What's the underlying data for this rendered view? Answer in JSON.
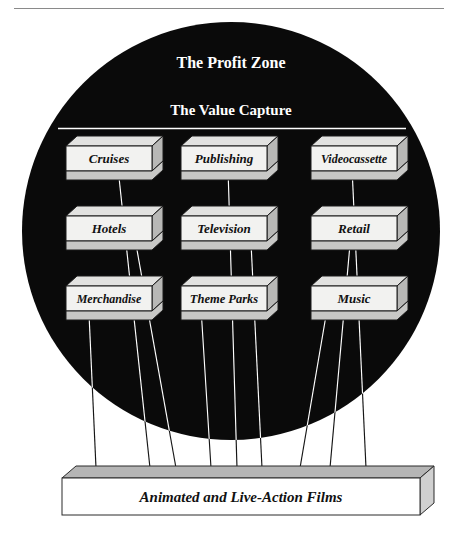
{
  "figure": {
    "header_partial_text": "",
    "zone": {
      "title": "The Profit Zone",
      "subtitle": "The Value Capture",
      "fill_color": "#0a0a0a",
      "text_color": "#ffffff"
    },
    "base": {
      "label": "Animated and Live-Action Films",
      "face_color": "#ffffff",
      "top_color": "#b5b5b5",
      "side_color": "#d0d0d0",
      "edge_color": "#2a2a2a"
    },
    "box_style": {
      "face_color": "#f2f2f0",
      "top_color": "#e2e2e0",
      "side_color": "#b8b8b6",
      "bottom_color": "#c8c8c6",
      "edge_color": "#1a1a1a"
    },
    "arrow_style": {
      "inside_color": "#ffffff",
      "outside_color": "#1a1a1a"
    },
    "rows": [
      {
        "row": 1,
        "boxes": [
          {
            "label": "Cruises",
            "column": "left"
          },
          {
            "label": "Publishing",
            "column": "center"
          },
          {
            "label": "Videocassette",
            "column": "right"
          }
        ]
      },
      {
        "row": 2,
        "boxes": [
          {
            "label": "Hotels",
            "column": "left"
          },
          {
            "label": "Television",
            "column": "center"
          },
          {
            "label": "Retail",
            "column": "right"
          }
        ]
      },
      {
        "row": 3,
        "boxes": [
          {
            "label": "Merchandise",
            "column": "left"
          },
          {
            "label": "Theme Parks",
            "column": "center"
          },
          {
            "label": "Music",
            "column": "right"
          }
        ]
      }
    ]
  }
}
